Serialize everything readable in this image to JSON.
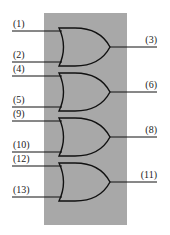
{
  "diagram": {
    "type": "quad 2-input OR gate pinout",
    "background_color": "#a8a8a8",
    "gates": [
      {
        "inputs": [
          "(1)",
          "(2)"
        ],
        "output": "(3)"
      },
      {
        "inputs": [
          "(4)",
          "(5)"
        ],
        "output": "(6)"
      },
      {
        "inputs": [
          "(9)",
          "(10)"
        ],
        "output": "(8)"
      },
      {
        "inputs": [
          "(12)",
          "(13)"
        ],
        "output": "(11)"
      }
    ]
  }
}
